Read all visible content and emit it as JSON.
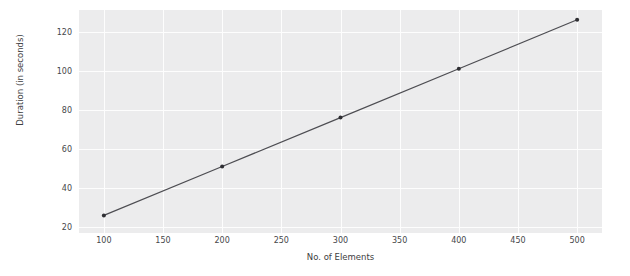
{
  "chart_data": {
    "type": "line",
    "title": "",
    "xlabel": "No. of Elements",
    "ylabel": "Duration (in seconds)",
    "x": [
      100,
      200,
      300,
      400,
      500
    ],
    "values": [
      26,
      51,
      76,
      101,
      126
    ],
    "series": [
      {
        "name": "Duration",
        "x": [
          100,
          200,
          300,
          400,
          500
        ],
        "values": [
          26,
          51,
          76,
          101,
          126
        ]
      }
    ],
    "xlim": [
      79,
      521
    ],
    "ylim": [
      17,
      131
    ],
    "xticks": [
      100,
      150,
      200,
      250,
      300,
      350,
      400,
      450,
      500
    ],
    "xtick_labels": [
      "100",
      "150",
      "200",
      "250",
      "300",
      "350",
      "400",
      "450",
      "500"
    ],
    "yticks": [
      20,
      40,
      60,
      80,
      100,
      120
    ],
    "ytick_labels": [
      "20",
      "40",
      "60",
      "80",
      "100",
      "120"
    ],
    "grid": true,
    "legend": "none",
    "line_color": "#4d4d52",
    "marker_color": "#2f2f33",
    "panel_color": "#ececed",
    "grid_color": "#fdfdfd",
    "figure_color": "#ffffff",
    "tick_text_color": "#46474a",
    "axis_label_color": "#3d3e41"
  }
}
